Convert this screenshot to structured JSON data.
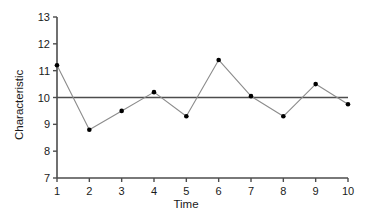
{
  "chart_data": {
    "type": "line",
    "title": "",
    "xlabel": "Time",
    "ylabel": "Characteristic",
    "x": [
      1,
      2,
      3,
      4,
      5,
      6,
      7,
      8,
      9,
      10
    ],
    "values": [
      11.2,
      8.8,
      9.5,
      10.2,
      9.3,
      11.4,
      10.05,
      9.3,
      10.5,
      9.75
    ],
    "series": [
      {
        "name": "Characteristic",
        "values": [
          11.2,
          8.8,
          9.5,
          10.2,
          9.3,
          11.4,
          10.05,
          9.3,
          10.5,
          9.75
        ],
        "color": "#8c8c8c",
        "marker": "circle",
        "marker_color": "#000000"
      }
    ],
    "reference_line": {
      "name": "center-line",
      "value": 10,
      "orientation": "horizontal",
      "color": "#4d4d4d"
    },
    "xlim": [
      1,
      10
    ],
    "ylim": [
      7,
      13
    ],
    "xticks": [
      1,
      2,
      3,
      4,
      5,
      6,
      7,
      8,
      9,
      10
    ],
    "yticks": [
      7,
      8,
      9,
      10,
      11,
      12,
      13
    ],
    "xtick_labels": [
      "1",
      "2",
      "3",
      "4",
      "5",
      "6",
      "7",
      "8",
      "9",
      "10"
    ],
    "ytick_labels": [
      "7",
      "8",
      "9",
      "10",
      "11",
      "12",
      "13"
    ],
    "grid": false,
    "legend": false,
    "axis_color": "#4d4d4d",
    "background": "#ffffff"
  }
}
